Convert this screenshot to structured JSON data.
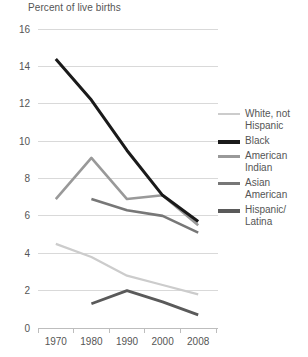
{
  "chart_data": {
    "type": "line",
    "title": "Percent of live births",
    "xlabel": "",
    "ylabel": "Percent of live births",
    "x": [
      1970,
      1980,
      1990,
      2000,
      2008
    ],
    "xtick_labels": [
      "1970",
      "1980",
      "1990",
      "2000",
      "2008"
    ],
    "ytick_labels": [
      "0",
      "2",
      "4",
      "6",
      "8",
      "10",
      "12",
      "14",
      "16"
    ],
    "ytick_values": [
      0,
      2,
      4,
      6,
      8,
      10,
      12,
      14,
      16
    ],
    "ylim": [
      0,
      16
    ],
    "grid": true,
    "legend_position": "right",
    "series": [
      {
        "name": "White, not Hispanic",
        "label": "White, not\nHispanic",
        "color": "#cccccc",
        "width": 2.2,
        "x": [
          1970,
          1980,
          1990,
          2000,
          2008
        ],
        "values": [
          4.5,
          3.8,
          2.8,
          2.3,
          1.8
        ]
      },
      {
        "name": "Black",
        "label": "Black",
        "color": "#1a1a1a",
        "width": 3.0,
        "x": [
          1970,
          1980,
          1990,
          2000,
          2008
        ],
        "values": [
          14.4,
          12.2,
          9.5,
          7.1,
          5.7
        ]
      },
      {
        "name": "American Indian",
        "label": "American\nIndian",
        "color": "#999999",
        "width": 2.6,
        "x": [
          1970,
          1980,
          1990,
          2000,
          2008
        ],
        "values": [
          6.9,
          9.1,
          6.9,
          7.1,
          5.5
        ]
      },
      {
        "name": "Asian American",
        "label": "Asian\nAmerican",
        "color": "#777777",
        "width": 2.6,
        "x": [
          1980,
          1990,
          2000,
          2008
        ],
        "values": [
          6.9,
          6.3,
          6.0,
          5.1
        ]
      },
      {
        "name": "Hispanic/Latina",
        "label": "Hispanic/\nLatina",
        "color": "#5a5a5a",
        "width": 2.8,
        "x": [
          1980,
          1990,
          2000,
          2008
        ],
        "values": [
          1.3,
          2.0,
          1.4,
          0.7
        ]
      }
    ]
  },
  "legend": {
    "items": [
      {
        "label": "White, not\nHispanic",
        "color": "#cccccc",
        "thickness": "2px"
      },
      {
        "label": "Black",
        "color": "#1a1a1a",
        "thickness": "3.5px"
      },
      {
        "label": "American\nIndian",
        "color": "#999999",
        "thickness": "3px"
      },
      {
        "label": "Asian\nAmerican",
        "color": "#777777",
        "thickness": "3px"
      },
      {
        "label": "Hispanic/\nLatina",
        "color": "#5a5a5a",
        "thickness": "3.5px"
      }
    ]
  }
}
